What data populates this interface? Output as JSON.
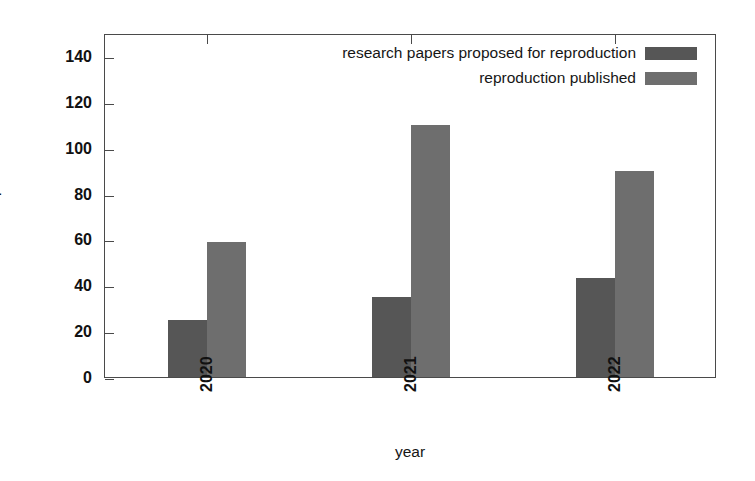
{
  "chart_data": {
    "type": "bar",
    "title": "",
    "xlabel": "year",
    "ylabel": "Number of repro/submissions",
    "categories": [
      "2020",
      "2021",
      "2022"
    ],
    "series": [
      {
        "name": "research papers proposed for reproduction",
        "color": "#565656",
        "values": [
          25,
          35,
          43
        ]
      },
      {
        "name": "reproduction published",
        "color": "#6e6e6e",
        "values": [
          59,
          110,
          90
        ]
      }
    ],
    "ylim": [
      0,
      150
    ],
    "yticks": [
      0,
      20,
      40,
      60,
      80,
      100,
      120,
      140
    ],
    "ytick_labels": [
      "0",
      "20",
      "40",
      "60",
      "80",
      "100",
      "120",
      "140"
    ],
    "xtick_labels": [
      "2020",
      "2021",
      "2022"
    ],
    "grid": false,
    "legend_position": "top-right",
    "xtick_rotation": 90,
    "frame": true
  },
  "axes": {
    "y_title": "Number of repro/submissions",
    "x_title": "year"
  },
  "legend": {
    "entries": [
      {
        "label": "research papers proposed for reproduction",
        "color": "#565656"
      },
      {
        "label": "reproduction published",
        "color": "#6e6e6e"
      }
    ]
  }
}
